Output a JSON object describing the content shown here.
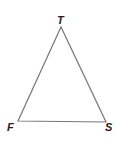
{
  "diagram": {
    "type": "triangle",
    "vertices": [
      {
        "label": "T",
        "x": 61,
        "y": 27,
        "label_x": 57,
        "label_y": 24
      },
      {
        "label": "F",
        "x": 18,
        "y": 121,
        "label_x": 7,
        "label_y": 131
      },
      {
        "label": "S",
        "x": 106,
        "y": 122,
        "label_x": 105,
        "label_y": 131
      }
    ],
    "stroke_color": "#777777",
    "label_color": "#222222"
  }
}
